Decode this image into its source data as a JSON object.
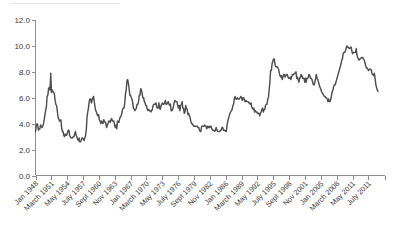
{
  "chart_data": {
    "type": "line",
    "title": "",
    "subtitle": "",
    "xlabel": "",
    "ylabel": "",
    "ylim": [
      0.0,
      12.0
    ],
    "ytick_labels": [
      "0.0",
      "2.0",
      "4.0",
      "6.0",
      "8.0",
      "10.0",
      "12.0"
    ],
    "ytick_values": [
      0.0,
      2.0,
      4.0,
      6.0,
      8.0,
      10.0,
      12.0
    ],
    "grid": false,
    "legend": null,
    "legend_position": "none",
    "line_color": "#4f4f4f",
    "axis_color": "#8d8d8d",
    "xtick_labels": [
      "Jan 1948",
      "March 1951",
      "May 1954",
      "July 1957",
      "Sept 1960",
      "Nov 1963",
      "Jan 1967",
      "March 1970",
      "May 1973",
      "July 1976",
      "Sept 1979",
      "Nov 1982",
      "Jan 1986",
      "March 1989",
      "May 1992",
      "July 1995",
      "Sept 1998",
      "Nov 2001",
      "Jan 2005",
      "March 2008",
      "May 2011",
      "July 2011"
    ],
    "x_start_label": "Jan 1948",
    "x_end_label": "July 2011",
    "series": [
      {
        "name": "",
        "values": [
          3.4,
          3.8,
          4.0,
          3.9,
          3.5,
          3.6,
          3.6,
          3.9,
          3.8,
          3.7,
          3.8,
          4.0,
          4.3,
          4.7,
          5.0,
          5.3,
          6.1,
          6.2,
          6.7,
          6.8,
          6.6,
          7.9,
          6.4,
          6.6,
          6.5,
          6.4,
          6.3,
          5.8,
          5.5,
          5.4,
          5.0,
          4.5,
          4.4,
          4.2,
          4.2,
          4.3,
          3.7,
          3.4,
          3.4,
          3.1,
          3.0,
          3.2,
          3.1,
          3.1,
          3.3,
          3.5,
          3.5,
          3.1,
          3.0,
          2.9,
          2.9,
          2.9,
          3.0,
          3.0,
          3.2,
          3.4,
          3.1,
          3.0,
          2.8,
          2.7,
          2.9,
          2.6,
          2.6,
          2.7,
          2.9,
          2.9,
          2.8,
          2.7,
          2.9,
          3.1,
          3.5,
          4.5,
          4.9,
          5.2,
          5.7,
          5.9,
          5.9,
          5.6,
          5.8,
          6.0,
          6.1,
          5.7,
          5.3,
          5.0,
          4.9,
          4.7,
          4.6,
          4.7,
          4.3,
          4.2,
          4.0,
          4.2,
          4.1,
          4.0,
          4.3,
          4.2,
          4.1,
          4.0,
          3.7,
          3.9,
          4.0,
          4.2,
          4.2,
          4.1,
          4.3,
          4.4,
          4.2,
          4.2,
          4.2,
          3.9,
          3.7,
          3.9,
          3.6,
          4.2,
          4.1,
          4.1,
          4.4,
          4.5,
          4.6,
          4.8,
          5.1,
          5.2,
          5.2,
          5.6,
          6.3,
          6.6,
          7.3,
          7.4,
          7.1,
          6.7,
          6.2,
          6.2,
          6.0,
          5.9,
          5.6,
          5.2,
          5.1,
          5.0,
          5.1,
          5.2,
          5.5,
          5.5,
          5.7,
          6.2,
          6.2,
          6.7,
          6.6,
          6.3,
          6.0,
          6.0,
          5.7,
          5.6,
          5.4,
          5.4,
          5.1,
          5.0,
          5.1,
          5.0,
          5.0,
          4.9,
          5.0,
          5.1,
          5.4,
          5.5,
          5.5,
          5.5,
          5.6,
          5.3,
          5.2,
          5.2,
          5.6,
          5.2,
          5.1,
          5.4,
          5.5,
          5.6,
          5.5,
          5.5,
          5.6,
          5.8,
          5.5,
          5.5,
          5.6,
          5.7,
          5.5,
          5.4,
          5.5,
          5.0,
          5.0,
          5.1,
          5.3,
          5.6,
          5.8,
          5.7,
          5.7,
          5.7,
          5.4,
          5.2,
          5.4,
          5.0,
          5.4,
          5.5,
          5.7,
          5.2,
          5.2,
          4.8,
          4.9,
          5.4,
          5.2,
          5.1,
          4.7,
          4.8,
          4.6,
          4.5,
          4.2,
          4.0,
          4.0,
          3.9,
          3.8,
          3.8,
          3.8,
          3.8,
          3.8,
          3.8,
          3.7,
          3.7,
          3.5,
          3.4,
          3.4,
          3.8,
          3.8,
          3.8,
          3.8,
          3.9,
          3.8,
          3.8,
          3.6,
          3.8,
          3.7,
          3.8,
          3.7,
          3.8,
          3.8,
          3.6,
          3.5,
          3.5,
          3.5,
          3.4,
          3.5,
          3.7,
          3.5,
          3.4,
          3.4,
          3.4,
          3.4,
          3.5,
          3.5,
          3.7,
          3.7,
          3.5,
          3.5,
          3.5,
          3.4,
          3.4,
          3.9,
          4.2,
          4.4,
          4.6,
          4.8,
          4.9,
          5.0,
          5.1,
          5.4,
          5.5,
          5.9,
          6.1,
          5.9,
          5.9,
          6.0,
          5.9,
          5.9,
          5.9,
          6.0,
          6.1,
          6.0,
          5.8,
          6.0,
          6.0,
          5.8,
          5.7,
          5.8,
          5.7,
          5.7,
          5.7,
          5.6,
          5.6,
          5.5,
          5.6,
          5.3,
          5.2,
          5.1,
          5.2,
          4.9,
          5.0,
          4.9,
          4.9,
          4.8,
          4.8,
          4.8,
          4.6,
          4.8,
          4.9,
          5.1,
          5.2,
          4.9,
          5.1,
          5.1,
          5.4,
          5.5,
          5.5,
          5.9,
          6.0,
          6.6,
          7.2,
          8.1,
          8.1,
          8.6,
          8.8,
          9.0,
          9.0,
          8.6,
          8.4,
          8.4,
          8.4,
          8.3,
          8.2,
          7.9,
          7.7,
          7.6,
          7.7,
          7.4,
          7.6,
          7.8,
          7.8,
          7.6,
          7.7,
          7.8,
          7.8,
          7.6,
          7.5,
          7.5,
          7.6,
          7.4,
          7.6,
          7.8,
          7.8,
          7.8,
          7.9,
          7.9,
          8.0,
          7.5,
          7.6,
          7.4,
          7.2,
          7.5,
          7.6,
          7.8,
          7.7,
          7.5,
          7.5,
          7.5,
          7.2,
          7.5,
          7.2,
          7.5,
          7.5,
          7.6,
          7.8,
          7.7,
          7.5,
          7.5,
          7.4,
          7.2,
          7.0,
          7.0,
          7.2,
          7.5,
          7.8,
          7.5,
          7.4,
          7.2,
          7.0,
          6.8,
          6.7,
          6.5,
          6.4,
          6.3,
          6.2,
          6.1,
          6.1,
          6.0,
          6.0,
          5.9,
          5.7,
          5.9,
          5.7,
          5.7,
          5.9,
          6.2,
          6.5,
          6.6,
          6.9,
          7.0,
          7.0,
          7.2,
          7.4,
          7.6,
          7.8,
          8.0,
          8.2,
          8.4,
          8.6,
          8.9,
          9.0,
          9.4,
          9.5,
          9.5,
          9.6,
          9.8,
          10.0,
          9.9,
          9.9,
          9.8,
          9.8,
          9.9,
          9.9,
          9.6,
          9.4,
          9.5,
          9.5,
          9.5,
          9.5,
          9.8,
          9.3,
          9.1,
          9.0,
          8.9,
          9.0,
          9.0,
          9.1,
          9.1,
          9.1,
          9.0,
          8.9,
          8.7,
          8.5,
          8.3,
          8.3,
          8.2,
          8.1,
          8.2,
          8.2,
          8.2,
          8.1,
          7.8,
          7.8,
          7.7,
          7.9,
          7.5,
          7.0,
          6.8,
          6.6,
          6.5
        ]
      }
    ],
    "notable_points": [
      {
        "label": "1949 recession peak",
        "value": 7.9
      },
      {
        "label": "1982 recession peak",
        "value": 10.8
      },
      {
        "label": "2009 recession peak",
        "value": 10.0
      },
      {
        "label": "1953 trough",
        "value": 2.5
      },
      {
        "label": "final value",
        "value": 6.5
      }
    ]
  }
}
